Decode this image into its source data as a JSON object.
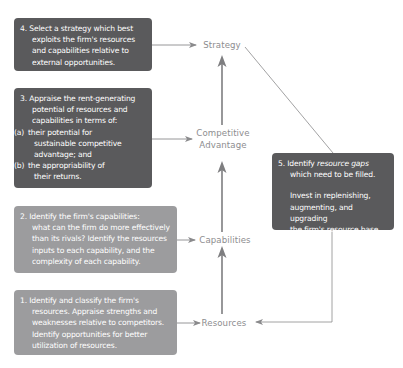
{
  "nodes": {
    "strategy": "Strategy",
    "competitive_advantage_line1": "Competitive",
    "competitive_advantage_line2": "Advantage",
    "capabilities": "Capabilities",
    "resources": "Resources"
  },
  "steps": {
    "step4": {
      "number": "4.",
      "lines": [
        "Select a strategy which best",
        "exploits the firm's resources",
        "and capabilities relative to",
        "external opportunities."
      ]
    },
    "step3": {
      "number": "3.",
      "lines": [
        "Appraise the rent-generating",
        "potential of resources and",
        "capabilities in terms of:"
      ],
      "items": [
        {
          "label": "(a)",
          "lines": [
            "their potential for",
            "sustainable competitive",
            "advantage; and"
          ]
        },
        {
          "label": "(b)",
          "lines": [
            "the appropriability of",
            "their returns."
          ]
        }
      ]
    },
    "step2": {
      "number": "2.",
      "lines": [
        "Identify the firm's capabilities:",
        "what can the firm do more effectively",
        "than its rivals? Identify the resources",
        "inputs to each capability, and the",
        "complexity of each capability."
      ]
    },
    "step1": {
      "number": "1.",
      "lines": [
        "Identify and classify the firm's",
        "resources. Appraise strengths and",
        "weaknesses relative to competitors.",
        "Identify opportunities for better",
        "utilization of resources."
      ]
    },
    "step5": {
      "number": "5.",
      "line1_prefix": "Identify ",
      "line1_emphasis": "resource gaps",
      "line2": "which need to be filled.",
      "para2": [
        "Invest in replenishing,",
        "augmenting, and upgrading",
        "the firm's resource base."
      ]
    }
  },
  "colors": {
    "dark_box": "#5a5a5c",
    "light_box": "#9c9c9e",
    "node_text": "#8d8d8f",
    "line": "#8a8a8c"
  }
}
